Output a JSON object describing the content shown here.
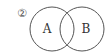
{
  "diagram": {
    "type": "venn",
    "marker": "②",
    "sets": [
      {
        "label": "A",
        "cx": 52,
        "cy": 29,
        "r": 22
      },
      {
        "label": "B",
        "cx": 82,
        "cy": 29,
        "r": 22
      }
    ],
    "stroke_color": "#555555",
    "background": "#ffffff"
  }
}
